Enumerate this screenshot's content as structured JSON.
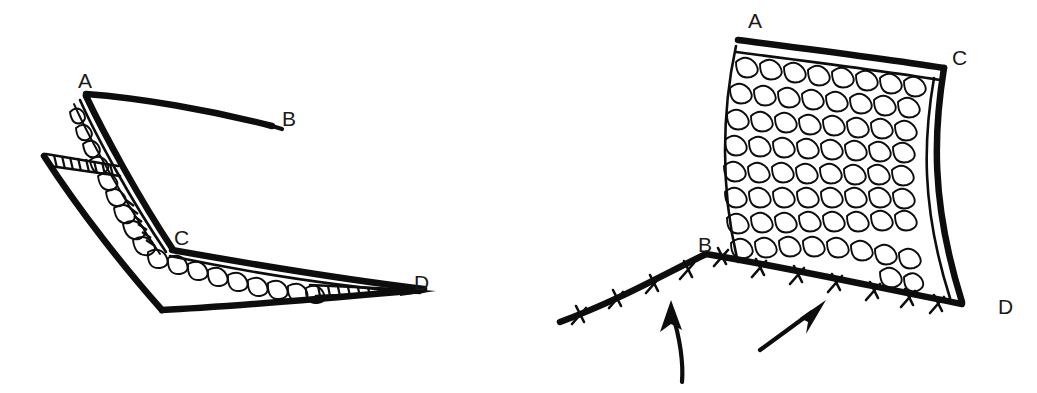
{
  "figure": {
    "panel_count": 2,
    "ink_color": "#0d0d0d",
    "background_color": "#ffffff",
    "style": "black-and-white line drawing"
  },
  "panels": [
    {
      "id": "left-panel",
      "name": "elevated-flap-panel",
      "description": "Folded flap elevated showing cut edges A-B and C-D with mucosal surface",
      "labels": [
        {
          "id": "label-a-left",
          "text": "A",
          "x": 78,
          "y": 70
        },
        {
          "id": "label-b-left",
          "text": "B",
          "x": 282,
          "y": 108
        },
        {
          "id": "label-c-left",
          "text": "C",
          "x": 174,
          "y": 227
        },
        {
          "id": "label-d-left",
          "text": "D",
          "x": 414,
          "y": 272
        }
      ],
      "features": [
        {
          "name": "cut-edge-hatching-upper",
          "description": "ladder hatch marks at upper left margin"
        },
        {
          "name": "cut-edge-hatching-lower",
          "description": "ladder hatch marks near D tip"
        },
        {
          "name": "mucosal-cobblestone-band",
          "description": "bubbly tissue band along fold"
        }
      ]
    },
    {
      "id": "right-panel",
      "name": "sutured-flap-panel",
      "description": "Flap rotated into place, inset edge B-D closed with interrupted sutures",
      "labels": [
        {
          "id": "label-a-right",
          "text": "A",
          "x": 748,
          "y": 10
        },
        {
          "id": "label-c-right",
          "text": "C",
          "x": 952,
          "y": 47
        },
        {
          "id": "label-b-right",
          "text": "B",
          "x": 698,
          "y": 234
        },
        {
          "id": "label-d-right",
          "text": "D",
          "x": 998,
          "y": 296
        }
      ],
      "features": [
        {
          "name": "mucosal-cobblestone-field",
          "description": "dense bubbly mucosal surface"
        },
        {
          "name": "suture-line",
          "description": "thick suture line from left through B to D"
        },
        {
          "name": "suture-stitch-count",
          "value": 12
        },
        {
          "name": "direction-arrow-left",
          "description": "curved arrow pointing up"
        },
        {
          "name": "direction-arrow-right",
          "description": "straight arrow pointing up-right"
        }
      ]
    }
  ],
  "legend": {
    "vertices": [
      "A",
      "B",
      "C",
      "D"
    ],
    "note": "Corresponding points A, B, C and D are marked in both panels"
  }
}
